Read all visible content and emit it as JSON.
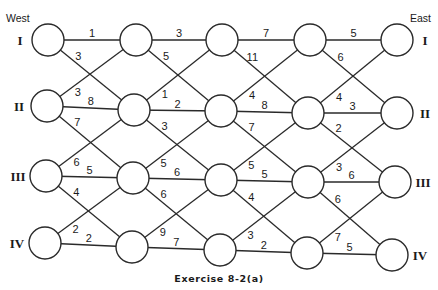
{
  "diagram": {
    "west_label": "West",
    "east_label": "East",
    "caption": "Exercise 8-2(a)",
    "rows": [
      "I",
      "II",
      "III",
      "IV"
    ],
    "node_positions": [
      [
        [
          48,
          40
        ],
        [
          136,
          40
        ],
        [
          222,
          40
        ],
        [
          310,
          40
        ],
        [
          397,
          40
        ]
      ],
      [
        [
          47,
          106
        ],
        [
          134,
          110
        ],
        [
          221,
          111
        ],
        [
          308,
          113
        ],
        [
          397,
          113
        ]
      ],
      [
        [
          46,
          176
        ],
        [
          133,
          178
        ],
        [
          221,
          180
        ],
        [
          308,
          182
        ],
        [
          395,
          182
        ]
      ],
      [
        [
          45,
          243
        ],
        [
          132,
          247
        ],
        [
          220,
          250
        ],
        [
          307,
          253
        ],
        [
          392,
          255
        ]
      ]
    ],
    "node_radius": 16,
    "horizontal_edges": [
      [
        1,
        3,
        7,
        5
      ],
      [
        8,
        2,
        8,
        3
      ],
      [
        5,
        6,
        5,
        6
      ],
      [
        2,
        7,
        2,
        5
      ]
    ],
    "diagonal_down_edges": [
      [
        3,
        5,
        11,
        6
      ],
      [
        7,
        3,
        7,
        2
      ],
      [
        4,
        6,
        4,
        6
      ]
    ],
    "diagonal_up_edges": [
      [
        3,
        1,
        4,
        4
      ],
      [
        6,
        5,
        5,
        3
      ],
      [
        2,
        9,
        3,
        7
      ]
    ]
  }
}
